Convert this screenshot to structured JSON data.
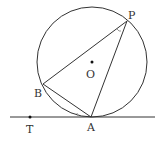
{
  "diagram": {
    "type": "geometry",
    "colors": {
      "stroke": "#333333",
      "angle_mark": "#999999",
      "background": "#ffffff"
    },
    "circle": {
      "center_label": "O",
      "cx": 92,
      "cy": 62,
      "r": 55
    },
    "points": {
      "P": {
        "label": "P",
        "x": 127,
        "y": 21
      },
      "B": {
        "label": "B",
        "x": 43,
        "y": 84
      },
      "A": {
        "label": "A",
        "x": 91,
        "y": 117
      },
      "T": {
        "label": "T",
        "x": 30,
        "y": 117
      },
      "O": {
        "label": "O",
        "x": 92,
        "y": 62
      }
    },
    "segments": [
      "PB",
      "PA",
      "BA"
    ],
    "tangent_line": {
      "through": "A",
      "passes": "T"
    },
    "angle_marks": [
      "angle BPA",
      "angle BAT"
    ]
  }
}
